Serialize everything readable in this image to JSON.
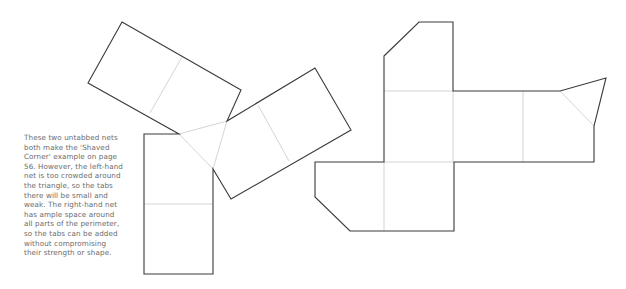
{
  "caption": {
    "lines": [
      "These two untabbed nets",
      "both make the 'Shaved",
      "Corner' example on page",
      "56. However, the left-hand",
      "net is too crowded around",
      "the triangle, so the tabs",
      "there will be small and",
      "weak. The right-hand net",
      "has ample space around",
      "all parts of the perimeter,",
      "so the tabs can be added",
      "without compromising",
      "their strength or shape."
    ]
  },
  "diagram": {
    "left_net": {
      "label": "left-hand net (crowded around triangle)",
      "colors": {
        "cut_line": "#3a3a3a",
        "fold_line": "#cfcfcf"
      }
    },
    "right_net": {
      "label": "right-hand net (ample perimeter space)",
      "colors": {
        "cut_line": "#3a3a3a",
        "fold_line": "#cfcfcf"
      }
    }
  }
}
